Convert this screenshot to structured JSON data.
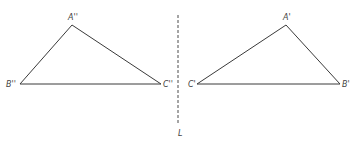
{
  "diagram": {
    "type": "reflection",
    "axis": {
      "label": "L",
      "x": 178,
      "y1": 15,
      "y2": 125
    },
    "triangles": [
      {
        "name": "image-triangle",
        "vertices": [
          {
            "label": "A''",
            "x": 72,
            "y": 25
          },
          {
            "label": "B''",
            "x": 20,
            "y": 84
          },
          {
            "label": "C''",
            "x": 161,
            "y": 84
          }
        ]
      },
      {
        "name": "original-triangle",
        "vertices": [
          {
            "label": "A'",
            "x": 286,
            "y": 25
          },
          {
            "label": "B'",
            "x": 340,
            "y": 84
          },
          {
            "label": "C'",
            "x": 197,
            "y": 84
          }
        ]
      }
    ]
  },
  "labels": {
    "a_double_prime": "A''",
    "b_double_prime": "B''",
    "c_double_prime": "C''",
    "a_prime": "A'",
    "b_prime": "B'",
    "c_prime": "C'",
    "axis": "L"
  }
}
